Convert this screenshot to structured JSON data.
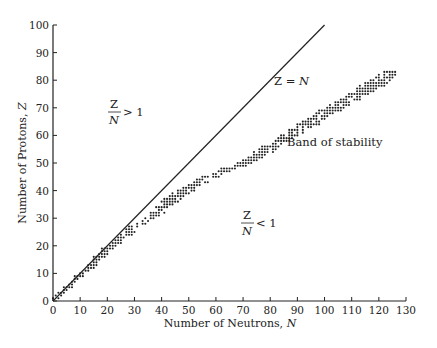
{
  "chart_data": {
    "type": "scatter",
    "title": "",
    "xlabel": "Number of Neutrons, N",
    "ylabel": "Number of Protons, Z",
    "xlim": [
      0,
      130
    ],
    "ylim": [
      0,
      100
    ],
    "x_ticks": [
      0,
      10,
      20,
      30,
      40,
      50,
      60,
      70,
      80,
      90,
      100,
      110,
      120,
      130
    ],
    "y_ticks": [
      0,
      10,
      20,
      30,
      40,
      50,
      60,
      70,
      80,
      90,
      100
    ],
    "grid": false,
    "legend": null,
    "series": [
      {
        "name": "Band of stability",
        "kind": "scatter",
        "curve_centerline": [
          [
            0,
            0
          ],
          [
            5,
            5
          ],
          [
            10,
            10
          ],
          [
            15,
            14
          ],
          [
            20,
            19
          ],
          [
            25,
            23
          ],
          [
            30,
            27
          ],
          [
            35,
            30
          ],
          [
            40,
            34
          ],
          [
            45,
            38
          ],
          [
            50,
            41
          ],
          [
            55,
            44
          ],
          [
            60,
            46
          ],
          [
            65,
            48
          ],
          [
            70,
            50
          ],
          [
            75,
            53
          ],
          [
            80,
            56
          ],
          [
            85,
            59
          ],
          [
            90,
            62
          ],
          [
            95,
            65
          ],
          [
            100,
            68
          ],
          [
            105,
            71
          ],
          [
            110,
            74
          ],
          [
            115,
            77
          ],
          [
            120,
            80
          ],
          [
            126,
            83
          ]
        ]
      },
      {
        "name": "Z = N",
        "kind": "line",
        "points": [
          [
            0,
            0
          ],
          [
            100,
            100
          ]
        ]
      }
    ],
    "annotations": [
      {
        "text": "Z = N",
        "x": 85,
        "y": 80
      },
      {
        "text": "Band of stability",
        "x": 86,
        "y": 57
      },
      {
        "text": "Z/N > 1",
        "x": 25,
        "y": 71
      },
      {
        "text": "Z/N < 1",
        "x": 68,
        "y": 31
      }
    ]
  },
  "labels": {
    "xlabel_text": "Number of Neutrons, ",
    "xlabel_var": "N",
    "ylabel_text": "Number of Protons, ",
    "ylabel_var": "Z",
    "line_label_left": "Z",
    "line_label_eq": " = ",
    "line_label_right": "N",
    "band_label": "Band of stability",
    "ratio_num": "Z",
    "ratio_den": "N",
    "ratio_gt": "> 1",
    "ratio_lt": "< 1"
  }
}
